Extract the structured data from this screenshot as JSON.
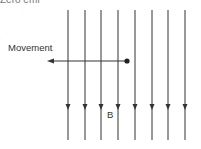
{
  "diagram": {
    "title_cropped": "Zero emf",
    "movement_label": "Movement",
    "field_label": "B",
    "field_lines_x": [
      68,
      85,
      101,
      118,
      135,
      152,
      168,
      185
    ],
    "field_line_top": 10,
    "field_line_bottom": 140,
    "arrow_y": 108,
    "movement_arrow": {
      "from_x": 127,
      "to_x": 48,
      "y": 61
    },
    "line_color": "#333333"
  }
}
